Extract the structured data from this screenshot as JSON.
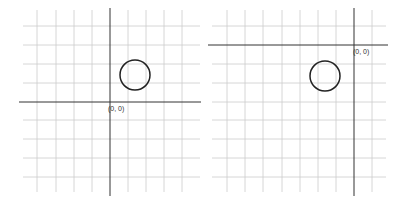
{
  "panels": [
    {
      "name": "left-grid",
      "origin_label": "(0, 0)",
      "vlines": [
        37,
        56,
        74,
        92,
        128,
        146,
        164,
        182
      ],
      "hlines": [
        26,
        45,
        64,
        83,
        120,
        139,
        158,
        177
      ],
      "grid_x": [
        23,
        200
      ],
      "grid_y": [
        10,
        192
      ],
      "axis_x": 110,
      "axis_y": 102,
      "axis_h_span": [
        19,
        201
      ],
      "axis_v_span": [
        8,
        196
      ],
      "circle": {
        "cx": 135,
        "cy": 75,
        "r": 15
      },
      "label_pos": [
        108,
        111
      ]
    },
    {
      "name": "right-grid",
      "origin_label": "(0, 0)",
      "vlines": [
        227,
        245,
        263,
        282,
        300,
        318,
        336,
        372
      ],
      "hlines": [
        26,
        64,
        83,
        102,
        120,
        139,
        158,
        177
      ],
      "grid_x": [
        212,
        386
      ],
      "grid_y": [
        10,
        192
      ],
      "axis_x": 354,
      "axis_y": 45,
      "axis_h_span": [
        208,
        388
      ],
      "axis_v_span": [
        8,
        196
      ],
      "circle": {
        "cx": 325,
        "cy": 76,
        "r": 15
      },
      "label_pos": [
        353,
        54
      ]
    }
  ],
  "colors": {
    "grid": "#cccccc",
    "axis": "#333333",
    "circle": "#222222"
  }
}
